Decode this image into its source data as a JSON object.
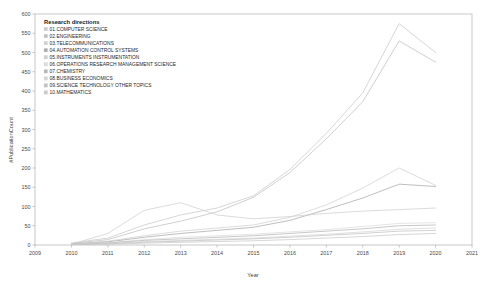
{
  "chart_data": {
    "type": "line",
    "title": "",
    "xlabel": "Year",
    "ylabel": "#PublicationCount",
    "xlim": [
      2009,
      2021
    ],
    "ylim": [
      0,
      600
    ],
    "grid": false,
    "legend_position": "upper-left",
    "legend_title": "Research directions",
    "x_ticks": [
      "2009",
      "2010",
      "2011",
      "2012",
      "2013",
      "2014",
      "2015",
      "2016",
      "2017",
      "2018",
      "2019",
      "2020",
      "2021"
    ],
    "y_ticks": [
      "0",
      "50",
      "100",
      "150",
      "200",
      "250",
      "300",
      "350",
      "400",
      "450",
      "500",
      "550",
      "600"
    ],
    "x": [
      2010,
      2011,
      2012,
      2013,
      2014,
      2015,
      2016,
      2017,
      2018,
      2019,
      2020
    ],
    "series": [
      {
        "name": "01.COMPUTER SCIENCE",
        "color": "#c8c8c8",
        "values": [
          5,
          18,
          52,
          78,
          96,
          128,
          196,
          290,
          395,
          575,
          500
        ]
      },
      {
        "name": "02.ENGINEERING",
        "color": "#bfbfbf",
        "values": [
          4,
          14,
          42,
          62,
          86,
          124,
          188,
          276,
          372,
          530,
          475
        ]
      },
      {
        "name": "03.TELECOMMUNICATIONS",
        "color": "#d0d0d0",
        "values": [
          3,
          10,
          24,
          36,
          44,
          52,
          72,
          104,
          148,
          200,
          155
        ]
      },
      {
        "name": "04.AUTOMATION CONTROL SYSTEMS",
        "color": "#a8a8a8",
        "values": [
          2,
          8,
          20,
          30,
          38,
          46,
          64,
          92,
          122,
          158,
          152
        ]
      },
      {
        "name": "05.INSTRUMENTS INSTRUMENTATION",
        "color": "#cfcfcf",
        "values": [
          2,
          30,
          90,
          110,
          78,
          68,
          74,
          82,
          88,
          92,
          96
        ]
      },
      {
        "name": "06.OPERATIONS RESEARCH MANAGEMENT SCIENCE",
        "color": "#dcdcdc",
        "values": [
          2,
          6,
          14,
          20,
          24,
          28,
          34,
          40,
          48,
          56,
          58
        ]
      },
      {
        "name": "07.CHEMISTRY",
        "color": "#b5b5b5",
        "values": [
          2,
          5,
          12,
          16,
          20,
          24,
          30,
          36,
          42,
          50,
          52
        ]
      },
      {
        "name": "08.BUSINESS ECONOMICS",
        "color": "#d6d6d6",
        "values": [
          1,
          4,
          9,
          12,
          15,
          18,
          23,
          28,
          34,
          41,
          44
        ]
      },
      {
        "name": "09.SCIENCE TECHNOLOGY OTHER TOPICS",
        "color": "#c2c2c2",
        "values": [
          1,
          3,
          7,
          10,
          13,
          16,
          20,
          25,
          30,
          36,
          38
        ]
      },
      {
        "name": "10.MATHEMATICS",
        "color": "#cacaca",
        "values": [
          1,
          2,
          5,
          7,
          9,
          11,
          14,
          18,
          22,
          27,
          30
        ]
      }
    ]
  }
}
